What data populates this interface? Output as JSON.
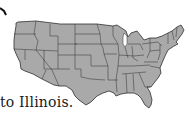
{
  "figure": {
    "type": "us-states-outline-map",
    "fill_color": "#a9a9a9",
    "border_color": "#2e2e2e",
    "arrow_color": "#111111"
  },
  "caption": {
    "text": "to Illinois."
  }
}
